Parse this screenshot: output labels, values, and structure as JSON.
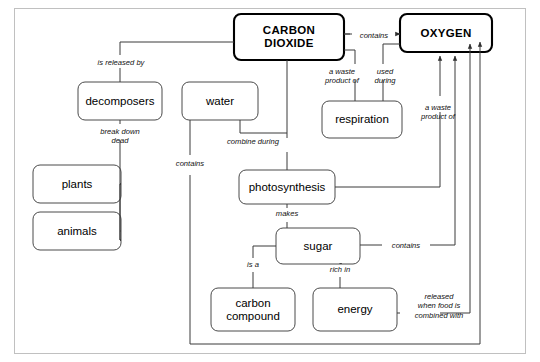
{
  "diagram": {
    "frame_color": "#b9b9b9",
    "line_color": "#3a3a3a",
    "node_border_color": "#4a4a4a",
    "emphasis_border_color": "#000000",
    "background": "#ffffff"
  },
  "nodes": [
    {
      "id": "carbon-dioxide",
      "label": "CARBON\nDIOXIDE",
      "emphasis": true,
      "x": 234,
      "y": 14,
      "w": 110,
      "h": 46
    },
    {
      "id": "oxygen",
      "label": "OXYGEN",
      "emphasis": true,
      "x": 400,
      "y": 14,
      "w": 92,
      "h": 38
    },
    {
      "id": "decomposers",
      "label": "decomposers",
      "emphasis": false,
      "x": 78,
      "y": 82,
      "w": 84,
      "h": 38
    },
    {
      "id": "water",
      "label": "water",
      "emphasis": false,
      "x": 182,
      "y": 82,
      "w": 76,
      "h": 38
    },
    {
      "id": "respiration",
      "label": "respiration",
      "emphasis": false,
      "x": 322,
      "y": 101,
      "w": 80,
      "h": 37
    },
    {
      "id": "plants",
      "label": "plants",
      "emphasis": false,
      "x": 33,
      "y": 165,
      "w": 88,
      "h": 38
    },
    {
      "id": "animals",
      "label": "animals",
      "emphasis": false,
      "x": 33,
      "y": 212,
      "w": 88,
      "h": 38
    },
    {
      "id": "photosynthesis",
      "label": "photosynthesis",
      "emphasis": false,
      "x": 239,
      "y": 170,
      "w": 96,
      "h": 34
    },
    {
      "id": "sugar",
      "label": "sugar",
      "emphasis": false,
      "x": 276,
      "y": 228,
      "w": 84,
      "h": 36
    },
    {
      "id": "carbon-compound",
      "label": "carbon\ncompound",
      "emphasis": false,
      "x": 211,
      "y": 288,
      "w": 84,
      "h": 43
    },
    {
      "id": "energy",
      "label": "energy",
      "emphasis": false,
      "x": 313,
      "y": 288,
      "w": 84,
      "h": 43
    }
  ],
  "link_labels": [
    {
      "id": "contains-co2-o2",
      "text": "contains",
      "x": 352,
      "y": 31,
      "w": 44
    },
    {
      "id": "is-released-by",
      "text": "is released by",
      "x": 85,
      "y": 58,
      "w": 72
    },
    {
      "id": "a-waste-product-of-resp",
      "text": "a waste\nproduct of",
      "x": 318,
      "y": 67,
      "w": 48
    },
    {
      "id": "used-during",
      "text": "used\nduring",
      "x": 368,
      "y": 67,
      "w": 34
    },
    {
      "id": "break-down-dead",
      "text": "break down\ndead",
      "x": 92,
      "y": 127,
      "w": 56
    },
    {
      "id": "a-waste-product-of-photo",
      "text": "a waste\nproduct of",
      "x": 414,
      "y": 103,
      "w": 48
    },
    {
      "id": "combine-during",
      "text": "combine during",
      "x": 216,
      "y": 142,
      "w": 74
    },
    {
      "id": "contains-water",
      "text": "contains",
      "x": 168,
      "y": 164,
      "w": 44
    },
    {
      "id": "makes",
      "text": "makes",
      "x": 270,
      "y": 211,
      "w": 34
    },
    {
      "id": "contains-sugar",
      "text": "contains",
      "x": 386,
      "y": 238,
      "w": 44
    },
    {
      "id": "is-a",
      "text": "is a",
      "x": 234,
      "y": 262,
      "w": 24
    },
    {
      "id": "rich-in",
      "text": "rich in",
      "x": 326,
      "y": 267,
      "w": 32
    },
    {
      "id": "released-when",
      "text": "released\nwhen food is\ncombined with",
      "x": 404,
      "y": 294,
      "w": 70
    }
  ],
  "edges": [
    {
      "id": "co2-to-oxygen",
      "from": "carbon-dioxide",
      "to": "oxygen",
      "relation": "contains",
      "arrow": true
    },
    {
      "id": "co2-to-decomposers",
      "from": "carbon-dioxide",
      "to": "decomposers",
      "relation": "is released by",
      "arrow": false
    },
    {
      "id": "co2-to-respiration",
      "from": "carbon-dioxide",
      "to": "respiration",
      "relation": "a waste product of",
      "arrow": false
    },
    {
      "id": "oxygen-to-respiration",
      "from": "oxygen",
      "to": "respiration",
      "relation": "used during",
      "arrow": false
    },
    {
      "id": "decomposers-to-plants",
      "from": "decomposers",
      "to": "plants",
      "relation": "break down dead",
      "arrow": false
    },
    {
      "id": "decomposers-to-animals",
      "from": "decomposers",
      "to": "animals",
      "relation": "break down dead",
      "arrow": false
    },
    {
      "id": "water-to-photosynthesis",
      "from": "water",
      "to": "photosynthesis",
      "relation": "combine during",
      "arrow": false
    },
    {
      "id": "co2-to-photosynthesis",
      "from": "carbon-dioxide",
      "to": "photosynthesis",
      "relation": "combine during",
      "arrow": false
    },
    {
      "id": "water-contains-oxygen",
      "from": "water",
      "to": "oxygen",
      "relation": "contains",
      "arrow": true
    },
    {
      "id": "photosynthesis-to-oxygen",
      "from": "photosynthesis",
      "to": "oxygen",
      "relation": "a waste product of",
      "arrow": true
    },
    {
      "id": "photosynthesis-to-sugar",
      "from": "photosynthesis",
      "to": "sugar",
      "relation": "makes",
      "arrow": false
    },
    {
      "id": "sugar-contains-oxygen",
      "from": "sugar",
      "to": "oxygen",
      "relation": "contains",
      "arrow": true
    },
    {
      "id": "sugar-to-carbon-compound",
      "from": "sugar",
      "to": "carbon-compound",
      "relation": "is a",
      "arrow": false
    },
    {
      "id": "sugar-to-energy",
      "from": "sugar",
      "to": "energy",
      "relation": "rich in",
      "arrow": false
    },
    {
      "id": "energy-to-oxygen",
      "from": "energy",
      "to": "oxygen",
      "relation": "released when food is combined with",
      "arrow": true
    }
  ]
}
